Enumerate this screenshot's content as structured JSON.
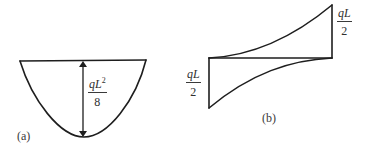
{
  "figure": {
    "panel_a": {
      "caption": "(a)",
      "shape": "parabola",
      "label": {
        "numerator_base": "qL",
        "numerator_exponent": "2",
        "denominator": "8"
      },
      "arrow": "double-headed vertical dimension arrow"
    },
    "panel_b": {
      "caption": "(b)",
      "shape": "antisymmetric curved diagram about horizontal baseline",
      "label_right": {
        "numerator": "qL",
        "denominator": "2"
      },
      "label_left": {
        "numerator": "qL",
        "denominator": "2"
      }
    },
    "colors": {
      "stroke": "#1e1e1e",
      "text": "#2f2f2f",
      "background": "#ffffff"
    }
  }
}
